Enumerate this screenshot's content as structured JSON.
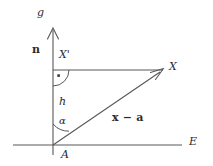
{
  "figure": {
    "background_color": "#ffffff",
    "stroke_color": "#4a4a4a",
    "text_color": "#2b2b2b"
  },
  "labels": {
    "vertical_axis": "g",
    "normal_vector": "n",
    "projection_point": "X'",
    "point_x": "X",
    "height": "h",
    "angle": "α",
    "vector_difference": "x − a",
    "origin_point": "A",
    "horizontal_axis": "E"
  },
  "geometry": {
    "origin_A": [
      53,
      145
    ],
    "point_X": [
      163,
      70
    ],
    "point_X_prime": [
      53,
      70
    ],
    "axis_g_top": [
      53,
      28
    ],
    "axis_E_left": [
      13,
      145
    ],
    "axis_E_right": [
      182,
      145
    ],
    "right_angle_marker_at": "X'",
    "angle_alpha_at": "A"
  }
}
